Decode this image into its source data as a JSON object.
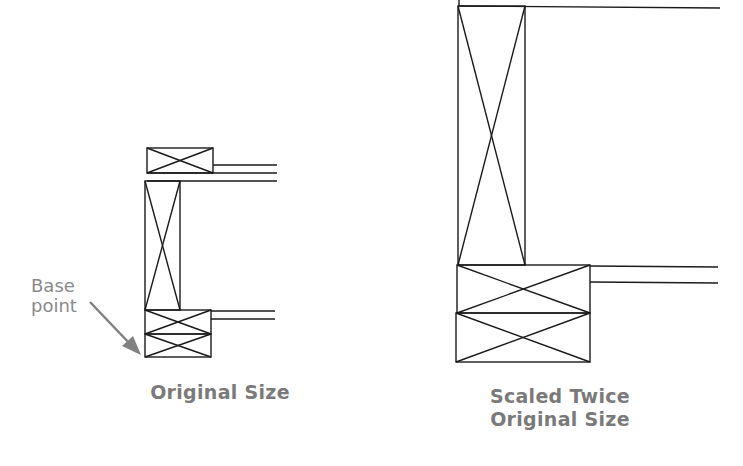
{
  "figure": {
    "annotation": {
      "line1": "Base",
      "line2": "point"
    },
    "captions": {
      "original": "Original Size",
      "scaled_line1": "Scaled Twice",
      "scaled_line2": "Original Size"
    },
    "colors": {
      "line": "#1a1a1a",
      "text": "#7a7a7a",
      "arrow": "#808080"
    }
  }
}
